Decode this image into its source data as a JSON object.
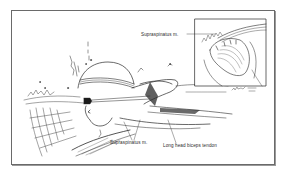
{
  "figure": {
    "type": "medical-illustration",
    "labels": {
      "supraspinatus_top": "Supraspinatus m.",
      "supraspinatus_bottom": "Supraspinatus m.",
      "biceps_tendon": "Long head biceps tendon"
    }
  },
  "colors": {
    "ink": "#2a2a2a",
    "frame": "#6a6a6a",
    "background": "#ffffff"
  }
}
